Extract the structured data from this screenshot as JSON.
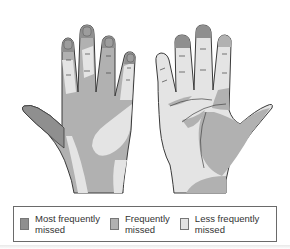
{
  "figure": {
    "views": [
      {
        "name": "back of hand",
        "side": "left"
      },
      {
        "name": "palm of hand",
        "side": "right"
      }
    ]
  },
  "colors": {
    "most_frequently_missed": "#8f8f8f",
    "frequently_missed": "#b1b1b1",
    "less_frequently_missed": "#e4e4e4",
    "outline": "#3a3a3a"
  },
  "legend": {
    "items": [
      {
        "label": "Most frequently\nmissed",
        "color": "#8f8f8f"
      },
      {
        "label": "Frequently\nmissed",
        "color": "#b1b1b1"
      },
      {
        "label": "Less frequently\nmissed",
        "color": "#e4e4e4"
      }
    ]
  }
}
